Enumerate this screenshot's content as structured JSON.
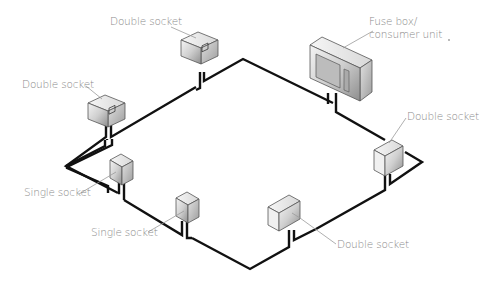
{
  "diagram": {
    "colors": {
      "wire": "#111111",
      "label_text": "#8a8a8a",
      "leader_line": "#9a9a9a",
      "socket_front": "#d9d9d9",
      "socket_top": "#efefef",
      "socket_side": "#bdbdbd",
      "background": "#ffffff"
    },
    "labels": [
      {
        "id": "fuse-box",
        "text_line1": "Fuse box/",
        "text_line2": "consumer unit"
      },
      {
        "id": "double-socket-top",
        "text": "Double socket"
      },
      {
        "id": "double-socket-left",
        "text": "Double socket"
      },
      {
        "id": "double-socket-right",
        "text": "Double socket"
      },
      {
        "id": "double-socket-bottom",
        "text": "Double socket"
      },
      {
        "id": "single-socket-left",
        "text": "Single socket"
      },
      {
        "id": "single-socket-middle",
        "text": "Single socket"
      }
    ],
    "components": [
      {
        "type": "consumer-unit",
        "label": "Fuse box/ consumer unit"
      },
      {
        "type": "double-socket",
        "label": "Double socket",
        "position": "top"
      },
      {
        "type": "double-socket",
        "label": "Double socket",
        "position": "left"
      },
      {
        "type": "double-socket",
        "label": "Double socket",
        "position": "right"
      },
      {
        "type": "double-socket",
        "label": "Double socket",
        "position": "bottom"
      },
      {
        "type": "single-socket",
        "label": "Single socket",
        "position": "left"
      },
      {
        "type": "single-socket",
        "label": "Single socket",
        "position": "middle"
      }
    ]
  }
}
